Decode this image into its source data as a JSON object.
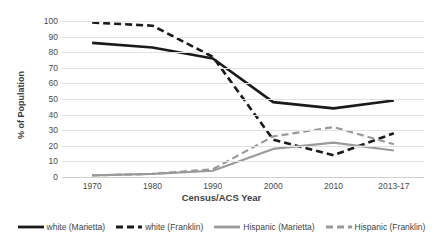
{
  "chart_data": {
    "type": "line",
    "title": "",
    "xlabel": "Census/ACS Year",
    "ylabel": "% of Population",
    "categories": [
      "1970",
      "1980",
      "1990",
      "2000",
      "2010",
      "2013-17"
    ],
    "ylim": [
      0,
      100
    ],
    "yticks": [
      100,
      90,
      80,
      70,
      60,
      50,
      40,
      30,
      20,
      10,
      0
    ],
    "grid": true,
    "legend_position": "bottom",
    "series": [
      {
        "name": "white (Marietta)",
        "color": "#1a1a1a",
        "style": "solid",
        "values": [
          86,
          83,
          76,
          48,
          44,
          49
        ]
      },
      {
        "name": "white (Franklin)",
        "color": "#1a1a1a",
        "style": "dashed",
        "values": [
          99,
          97,
          77,
          24,
          14,
          28
        ]
      },
      {
        "name": "Hispanic (Marietta)",
        "color": "#9a9a9a",
        "style": "solid",
        "values": [
          1,
          2,
          4,
          18,
          22,
          17
        ]
      },
      {
        "name": "Hispanic (Franklin)",
        "color": "#9a9a9a",
        "style": "dashed",
        "values": [
          1,
          2,
          5,
          26,
          32,
          21
        ]
      }
    ]
  },
  "legend": {
    "items": [
      {
        "label": "white (Marietta)"
      },
      {
        "label": "white (Franklin)"
      },
      {
        "label": "Hispanic (Marietta)"
      },
      {
        "label": "Hispanic (Franklin)"
      }
    ]
  }
}
